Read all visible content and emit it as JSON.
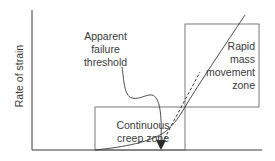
{
  "diagram": {
    "y_axis_label": "Rate of strain",
    "zones": {
      "continuous_creep": [
        "Continuous",
        "creep zone"
      ],
      "rapid_mass_movement": [
        "Rapid",
        "mass",
        "movement",
        "zone"
      ]
    },
    "annotation": [
      "Apparent",
      "failure",
      "threshold"
    ],
    "colors": {
      "line": "#3a3a3a",
      "box": "#6a6a6a",
      "axis": "#3a3a3a"
    }
  }
}
